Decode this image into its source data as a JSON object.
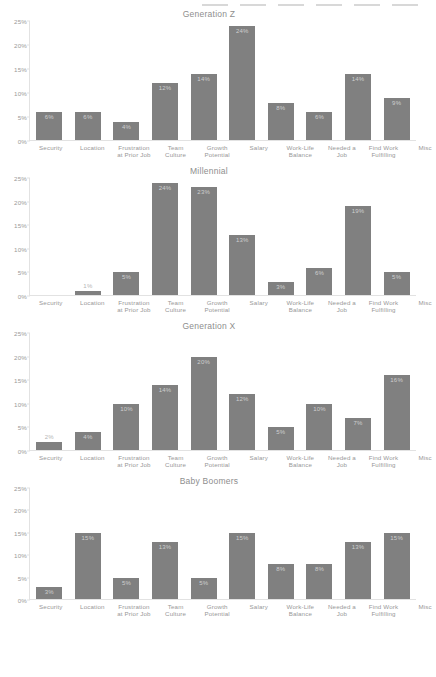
{
  "chart_data": [
    {
      "type": "bar",
      "title": "Generation Z",
      "xlabel": "",
      "ylabel": "",
      "ylim": [
        0,
        25
      ],
      "grid": false,
      "legend": "none",
      "ytick_labels": [
        "0%",
        "5%",
        "10%",
        "15%",
        "20%",
        "25%"
      ],
      "ytick_values": [
        0,
        5,
        10,
        15,
        20,
        25
      ],
      "categories": [
        "Security",
        "Location",
        "Frustration\nat Prior Job",
        "Team\nCulture",
        "Growth\nPotential",
        "Salary",
        "Work-Life\nBalance",
        "Needed a\nJob",
        "Find Work\nFulfilling",
        "Misc"
      ],
      "values": [
        6,
        6,
        4,
        12,
        14,
        24,
        8,
        6,
        14,
        9
      ],
      "value_labels": [
        "6%",
        "6%",
        "4%",
        "12%",
        "14%",
        "24%",
        "8%",
        "6%",
        "14%",
        "9%"
      ]
    },
    {
      "type": "bar",
      "title": "Millennial",
      "xlabel": "",
      "ylabel": "",
      "ylim": [
        0,
        25
      ],
      "grid": false,
      "legend": "none",
      "ytick_labels": [
        "0%",
        "5%",
        "10%",
        "15%",
        "20%",
        "25%"
      ],
      "ytick_values": [
        0,
        5,
        10,
        15,
        20,
        25
      ],
      "categories": [
        "Security",
        "Location",
        "Frustration\nat Prior Job",
        "Team\nCulture",
        "Growth\nPotential",
        "Salary",
        "Work-Life\nBalance",
        "Needed a\nJob",
        "Find Work\nFulfilling",
        "Misc"
      ],
      "values": [
        0,
        1,
        5,
        24,
        23,
        13,
        3,
        6,
        19,
        5
      ],
      "value_labels": [
        "",
        "1%",
        "5%",
        "24%",
        "23%",
        "13%",
        "3%",
        "6%",
        "19%",
        "5%"
      ]
    },
    {
      "type": "bar",
      "title": "Generation X",
      "xlabel": "",
      "ylabel": "",
      "ylim": [
        0,
        25
      ],
      "grid": false,
      "legend": "none",
      "ytick_labels": [
        "0%",
        "5%",
        "10%",
        "15%",
        "20%",
        "25%"
      ],
      "ytick_values": [
        0,
        5,
        10,
        15,
        20,
        25
      ],
      "categories": [
        "Security",
        "Location",
        "Frustration\nat Prior Job",
        "Team\nCulture",
        "Growth\nPotential",
        "Salary",
        "Work-Life\nBalance",
        "Needed a\nJob",
        "Find Work\nFulfilling",
        "Misc"
      ],
      "values": [
        2,
        4,
        10,
        14,
        20,
        12,
        5,
        10,
        7,
        16
      ],
      "value_labels": [
        "2%",
        "4%",
        "10%",
        "14%",
        "20%",
        "12%",
        "5%",
        "10%",
        "7%",
        "16%"
      ]
    },
    {
      "type": "bar",
      "title": "Baby Boomers",
      "xlabel": "",
      "ylabel": "",
      "ylim": [
        0,
        25
      ],
      "grid": false,
      "legend": "none",
      "ytick_labels": [
        "0%",
        "5%",
        "10%",
        "15%",
        "20%",
        "25%"
      ],
      "ytick_values": [
        0,
        5,
        10,
        15,
        20,
        25
      ],
      "categories": [
        "Security",
        "Location",
        "Frustration\nat Prior Job",
        "Team\nCulture",
        "Growth\nPotential",
        "Salary",
        "Work-Life\nBalance",
        "Needed a\nJob",
        "Find Work\nFulfilling",
        "Misc"
      ],
      "values": [
        3,
        15,
        5,
        13,
        5,
        15,
        8,
        8,
        13,
        15
      ],
      "value_labels": [
        "3%",
        "15%",
        "5%",
        "13%",
        "5%",
        "15%",
        "8%",
        "8%",
        "13%",
        "15%"
      ]
    }
  ],
  "style": {
    "bar_color": "#808080",
    "axis_color": "#e2e2e2",
    "title_color": "#8e8e8e",
    "tick_color": "#9a9a9a",
    "value_label_color": "#cfcfcf",
    "background": "#ffffff"
  }
}
